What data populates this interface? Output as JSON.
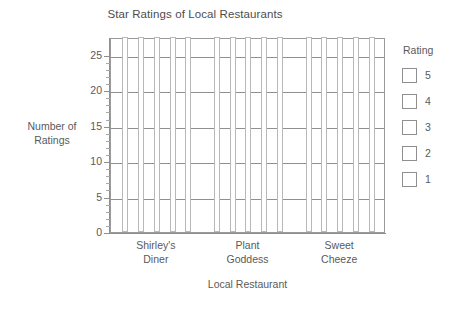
{
  "chart_data": {
    "type": "bar",
    "title": "Star Ratings of Local Restaurants",
    "xlabel": "Local Restaurant",
    "ylabel": "Number of\nRatings",
    "categories": [
      "Shirley's Diner",
      "Plant Goddess",
      "Sweet Cheeze"
    ],
    "legend_title": "Rating",
    "legend_position": "right",
    "grid": true,
    "ylim": [
      0,
      27.5
    ],
    "yticks": [
      0,
      5,
      10,
      15,
      20,
      25
    ],
    "ytick_labels": [
      "0",
      "5",
      "10",
      "15",
      "20",
      "25"
    ],
    "series": [
      {
        "name": "5",
        "values": [
          27.5,
          27.5,
          27.5
        ]
      },
      {
        "name": "4",
        "values": [
          27.5,
          27.5,
          27.5
        ]
      },
      {
        "name": "3",
        "values": [
          27.5,
          27.5,
          27.5
        ]
      },
      {
        "name": "2",
        "values": [
          27.5,
          27.5,
          27.5
        ]
      },
      {
        "name": "1",
        "values": [
          27.5,
          27.5,
          27.5
        ]
      }
    ]
  },
  "chart": {
    "title": "Star Ratings of Local Restaurants",
    "y_axis": {
      "title_line1": "Number of",
      "title_line2": "Ratings",
      "ticks": [
        "25",
        "20",
        "15",
        "10",
        "5",
        "0"
      ]
    },
    "x_axis": {
      "title": "Local Restaurant",
      "categories": [
        {
          "line1": "Shirley's",
          "line2": "Diner"
        },
        {
          "line1": "Plant",
          "line2": "Goddess"
        },
        {
          "line1": "Sweet",
          "line2": "Cheeze"
        }
      ]
    },
    "legend": {
      "title": "Rating",
      "items": [
        {
          "label": "5"
        },
        {
          "label": "4"
        },
        {
          "label": "3"
        },
        {
          "label": "2"
        },
        {
          "label": "1"
        }
      ]
    },
    "colors": {
      "axis": "#8f8f8f",
      "text": "#5a5a5a",
      "bar_outline": "#b8b8b8",
      "bar_fill": "#ffffff",
      "grid": "#8f8f8f"
    }
  }
}
